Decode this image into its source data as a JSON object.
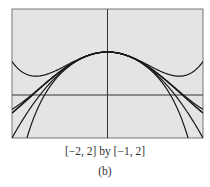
{
  "chart_data": {
    "type": "line",
    "title": "",
    "window": "[−2, 2] by [−1, 2]",
    "xlim": [
      -2,
      2
    ],
    "ylim": [
      -1,
      2
    ],
    "grid": false,
    "axes_drawn": true,
    "series": [
      {
        "name": "y = cos x",
        "expr": "cos"
      },
      {
        "name": "P2(x) = 1 - x^2/2",
        "expr": "p2"
      },
      {
        "name": "P4(x) = 1 - x^2/2 + x^4/24",
        "expr": "p4"
      },
      {
        "name": "P6(x) = 1 - x^2/2 + x^4/24 - x^6/720",
        "expr": "p6"
      },
      {
        "name": "Q4 (upward-turning quartic-like)",
        "expr": "u4"
      },
      {
        "name": "Q6 (downward-turning)",
        "expr": "d6"
      }
    ],
    "colors": {
      "background": "#e4e4e4",
      "frame": "#777777",
      "axes": "#333333",
      "curves": "#1a1a1a"
    }
  },
  "caption": {
    "range": "[−2, 2] by [−1, 2]",
    "label": "(b)"
  }
}
